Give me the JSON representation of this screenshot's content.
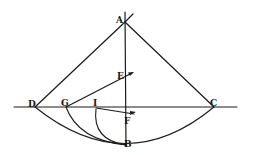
{
  "diagram": {
    "type": "geometric-construction",
    "colors": {
      "ink": "#1a1a1a",
      "paper": "#ffffff"
    },
    "labels": {
      "A": "A",
      "B": "B",
      "C": "C",
      "D": "D",
      "E": "E",
      "F": "F",
      "G": "G",
      "I": "I"
    },
    "points": {
      "A": [
        125,
        22
      ],
      "B": [
        126,
        145
      ],
      "C": [
        214,
        107
      ],
      "D": [
        35,
        107
      ],
      "E": [
        124,
        76
      ],
      "F": [
        126,
        116
      ],
      "G": [
        66,
        107
      ],
      "I": [
        96,
        107
      ]
    },
    "lines": [
      "A-D",
      "A-C",
      "vertical axis through A and B",
      "horizontal line through D, G, I, C",
      "G to arrow near E",
      "I to arrow near F"
    ],
    "arcs": [
      "D-B-C",
      "G-B",
      "I-B"
    ]
  }
}
